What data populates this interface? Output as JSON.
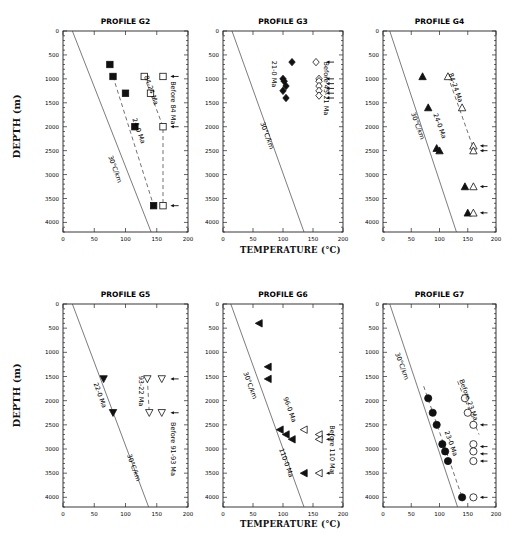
{
  "figure": {
    "y_axis_label": "DEPTH (m)",
    "x_axis_label": "TEMPERATURE (°C)"
  },
  "chart_data": [
    {
      "type": "scatter",
      "title": "PROFILE G2",
      "xlabel": "TEMPERATURE (°C)",
      "ylabel": "DEPTH (m)",
      "xlim": [
        0,
        200
      ],
      "ylim": [
        4200,
        0
      ],
      "xticks": [
        0,
        50,
        100,
        150,
        200
      ],
      "yticks": [
        0,
        500,
        1000,
        1500,
        2000,
        2500,
        3000,
        3500,
        4000
      ],
      "reference_line": {
        "label": "30°C/km",
        "points": [
          [
            15,
            0
          ],
          [
            141,
            4200
          ]
        ]
      },
      "series": [
        {
          "name": "24-0 Ma",
          "marker": "filled-square",
          "points": [
            [
              75,
              700
            ],
            [
              80,
              950
            ],
            [
              100,
              1300
            ],
            [
              115,
              2000
            ],
            [
              145,
              3650
            ]
          ],
          "trend": [
            [
              80,
              950
            ],
            [
              145,
              3650
            ]
          ]
        },
        {
          "name": "84-24 Ma",
          "marker": "open-square",
          "points": [
            [
              130,
              950
            ],
            [
              140,
              1300
            ],
            [
              160,
              2000
            ],
            [
              160,
              3650
            ]
          ],
          "trend": [
            [
              130,
              950
            ],
            [
              160,
              2000
            ],
            [
              160,
              3650
            ]
          ]
        },
        {
          "name": "Before 84 Ma",
          "marker": "open-square",
          "points": [
            [
              160,
              950
            ]
          ]
        }
      ],
      "arrows_depths": [
        950,
        2000,
        3650
      ],
      "annotations": [
        "30°C/km",
        "24-0 Ma",
        "84-24 Ma",
        "Before 84 Ma"
      ]
    },
    {
      "type": "scatter",
      "title": "PROFILE G3",
      "xlim": [
        0,
        200
      ],
      "ylim": [
        4200,
        0
      ],
      "xticks": [
        0,
        50,
        100,
        150,
        200
      ],
      "yticks": [
        0,
        500,
        1000,
        1500,
        2000,
        2500,
        3000,
        3500,
        4000
      ],
      "reference_line": {
        "label": "30°C/km",
        "points": [
          [
            15,
            0
          ],
          [
            135,
            4200
          ]
        ]
      },
      "series": [
        {
          "name": "21-0 Ma",
          "marker": "filled-diamond",
          "points": [
            [
              115,
              650
            ],
            [
              100,
              1000
            ],
            [
              102,
              1050
            ],
            [
              105,
              1150
            ],
            [
              100,
              1250
            ],
            [
              105,
              1400
            ]
          ]
        },
        {
          "name": "Before 45-21 Ma",
          "marker": "open-diamond",
          "points": [
            [
              155,
              650
            ],
            [
              160,
              1000
            ],
            [
              160,
              1050
            ],
            [
              160,
              1150
            ],
            [
              160,
              1250
            ],
            [
              160,
              1350
            ]
          ]
        }
      ],
      "arrows_depths": [
        650,
        1000,
        1100,
        1200,
        1300,
        1400
      ],
      "annotations": [
        "30°C/km",
        "21-0 Ma",
        "Before 45-21 Ma"
      ]
    },
    {
      "type": "scatter",
      "title": "PROFILE G4",
      "xlim": [
        0,
        200
      ],
      "ylim": [
        4200,
        0
      ],
      "xticks": [
        0,
        50,
        100,
        150,
        200
      ],
      "yticks": [
        0,
        500,
        1000,
        1500,
        2000,
        2500,
        3000,
        3500,
        4000
      ],
      "reference_line": {
        "label": "30°C/km",
        "points": [
          [
            12,
            0
          ],
          [
            130,
            4200
          ]
        ]
      },
      "series": [
        {
          "name": "24-0 Ma",
          "marker": "filled-triangle-up",
          "points": [
            [
              70,
              950
            ],
            [
              80,
              1600
            ],
            [
              95,
              2450
            ],
            [
              100,
              2500
            ],
            [
              145,
              3250
            ],
            [
              150,
              3800
            ]
          ]
        },
        {
          "name": "84-24 Ma",
          "marker": "open-triangle-up",
          "points": [
            [
              115,
              950
            ],
            [
              140,
              1600
            ],
            [
              160,
              2400
            ],
            [
              160,
              2500
            ],
            [
              160,
              3250
            ],
            [
              160,
              3800
            ]
          ],
          "trend": [
            [
              115,
              950
            ],
            [
              160,
              2450
            ]
          ]
        }
      ],
      "arrows_depths": [
        2400,
        2500,
        3250,
        3800
      ],
      "annotations": [
        "30°C/km",
        "24-0 Ma",
        "84-24 Ma"
      ]
    },
    {
      "type": "scatter",
      "title": "PROFILE G5",
      "xlim": [
        0,
        200
      ],
      "ylim": [
        4200,
        0
      ],
      "xticks": [
        0,
        50,
        100,
        150,
        200
      ],
      "yticks": [
        0,
        500,
        1000,
        1500,
        2000,
        2500,
        3000,
        3500,
        4000
      ],
      "reference_line": {
        "label": "30°C/km",
        "points": [
          [
            15,
            0
          ],
          [
            137,
            4200
          ]
        ]
      },
      "series": [
        {
          "name": "22-0 Ma",
          "marker": "filled-triangle-down",
          "points": [
            [
              65,
              1550
            ],
            [
              80,
              2250
            ]
          ]
        },
        {
          "name": "93-22 Ma",
          "marker": "open-triangle-down",
          "points": [
            [
              135,
              1550
            ],
            [
              138,
              2250
            ]
          ],
          "trend": [
            [
              135,
              1550
            ],
            [
              138,
              2250
            ]
          ]
        },
        {
          "name": "Before 91-93 Ma",
          "marker": "open-triangle-down",
          "points": [
            [
              158,
              1550
            ],
            [
              158,
              2250
            ]
          ]
        }
      ],
      "arrows_depths": [
        1550,
        2250
      ],
      "annotations": [
        "30°C/km",
        "22-0 Ma",
        "93-22 Ma",
        "Before 91-93 Ma"
      ]
    },
    {
      "type": "scatter",
      "title": "PROFILE G6",
      "xlim": [
        0,
        200
      ],
      "ylim": [
        4200,
        0
      ],
      "xticks": [
        0,
        50,
        100,
        150,
        200
      ],
      "yticks": [
        0,
        500,
        1000,
        1500,
        2000,
        2500,
        3000,
        3500,
        4000
      ],
      "reference_line": {
        "label": "30°C/km",
        "points": [
          [
            13,
            0
          ],
          [
            135,
            4200
          ]
        ]
      },
      "series": [
        {
          "name": "96-0 Ma / 110-0 Ma",
          "marker": "filled-triangle-left",
          "points": [
            [
              60,
              400
            ],
            [
              75,
              1300
            ],
            [
              75,
              1550
            ],
            [
              95,
              2600
            ],
            [
              105,
              2700
            ],
            [
              115,
              2800
            ],
            [
              135,
              3500
            ]
          ]
        },
        {
          "name": "Before 110 Ma",
          "marker": "open-triangle-left",
          "points": [
            [
              135,
              2600
            ],
            [
              160,
              2700
            ],
            [
              160,
              2800
            ],
            [
              160,
              3500
            ]
          ]
        }
      ],
      "arrows_depths": [
        2700,
        2800,
        3500
      ],
      "annotations": [
        "30°C/km",
        "96-0 Ma",
        "110-0 Ma",
        "Before 110 Ma"
      ]
    },
    {
      "type": "scatter",
      "title": "PROFILE G7",
      "xlim": [
        0,
        200
      ],
      "ylim": [
        4200,
        0
      ],
      "xticks": [
        0,
        50,
        100,
        150,
        200
      ],
      "yticks": [
        0,
        500,
        1000,
        1500,
        2000,
        2500,
        3000,
        3500,
        4000
      ],
      "reference_line": {
        "label": "30°C/km",
        "points": [
          [
            12,
            0
          ],
          [
            132,
            4200
          ]
        ]
      },
      "series": [
        {
          "name": "23-0 Ma",
          "marker": "filled-circle",
          "points": [
            [
              80,
              1950
            ],
            [
              88,
              2250
            ],
            [
              95,
              2500
            ],
            [
              105,
              2900
            ],
            [
              110,
              3050
            ],
            [
              115,
              3250
            ],
            [
              140,
              4000
            ]
          ],
          "trend": [
            [
              72,
              1700
            ],
            [
              140,
              4000
            ]
          ]
        },
        {
          "name": "Before 23 Ma",
          "marker": "open-circle",
          "points": [
            [
              145,
              1950
            ],
            [
              150,
              2250
            ],
            [
              160,
              2500
            ],
            [
              160,
              2900
            ],
            [
              160,
              3050
            ],
            [
              160,
              3250
            ],
            [
              160,
              4000
            ]
          ],
          "trend": [
            [
              132,
              1600
            ],
            [
              170,
              2700
            ]
          ]
        }
      ],
      "arrows_depths": [
        2500,
        2950,
        3100,
        3250,
        4000
      ],
      "annotations": [
        "30°C/km",
        "23-0 Ma",
        "Before 23 Ma"
      ]
    }
  ]
}
